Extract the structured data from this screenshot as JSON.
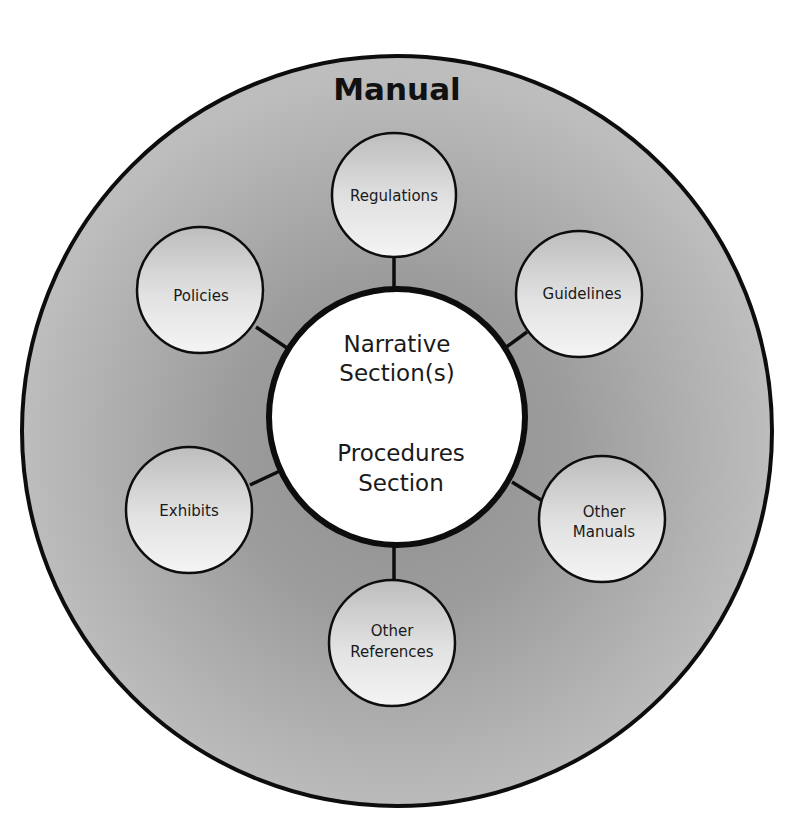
{
  "diagram": {
    "title": "Manual",
    "center": {
      "line1": "Narrative",
      "line2": "Section(s)",
      "line3": "Procedures",
      "line4": "Section"
    },
    "satellites": [
      {
        "id": "regulations",
        "lines": [
          "Regulations"
        ]
      },
      {
        "id": "guidelines",
        "lines": [
          "Guidelines"
        ]
      },
      {
        "id": "other-manuals",
        "lines": [
          "Other",
          "Manuals"
        ]
      },
      {
        "id": "other-references",
        "lines": [
          "Other",
          "References"
        ]
      },
      {
        "id": "exhibits",
        "lines": [
          "Exhibits"
        ]
      },
      {
        "id": "policies",
        "lines": [
          "Policies"
        ]
      }
    ],
    "colors": {
      "outer_fill": "#a6a6a6",
      "outer_edge_fill": "#bdbdbd",
      "outline": "#0d0d0d",
      "center_fill": "#ffffff",
      "satellite_light": "#f2f2f2",
      "satellite_dark": "#bfbfbf",
      "background": "#ffffff"
    }
  }
}
